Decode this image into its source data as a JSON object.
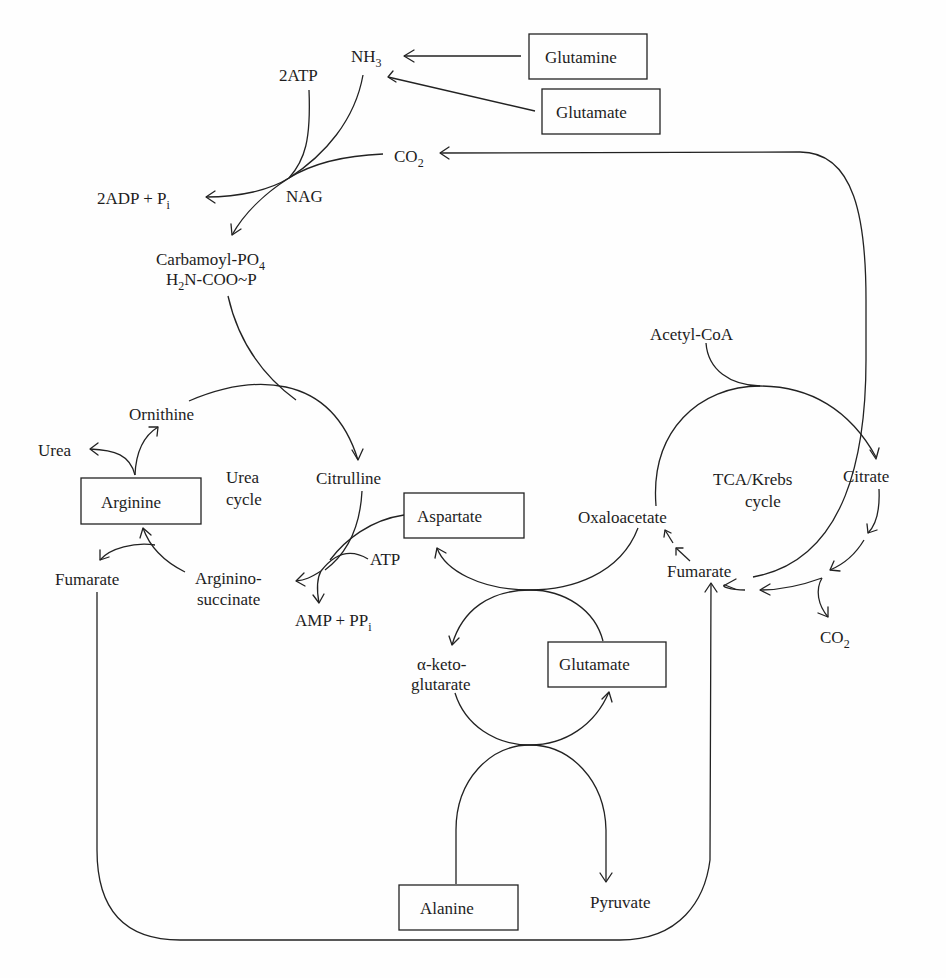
{
  "diagram": {
    "colors": {
      "line": "#222222",
      "text": "#1d1d1d",
      "background": "#fefefe"
    },
    "nodes": {
      "glutamine_top": "Glutamine",
      "glutamate_top": "Glutamate",
      "nh3": {
        "main": "NH",
        "sub": "3"
      },
      "atp2": "2ATP",
      "co2_top": {
        "main": "CO",
        "sub": "2"
      },
      "adp": {
        "main": "2ADP + P",
        "sub": "i"
      },
      "nag": "NAG",
      "carbamoyl_1": {
        "main": "Carbamoyl-PO",
        "sub": "4"
      },
      "carbamoyl_2": {
        "pre": "H",
        "sub": "2",
        "post": "N-COO~P"
      },
      "ornithine": "Ornithine",
      "urea": "Urea",
      "urea_cycle_1": "Urea",
      "urea_cycle_2": "cycle",
      "citrulline": "Citrulline",
      "arginine": "Arginine",
      "aspartate": "Aspartate",
      "atp": "ATP",
      "fumarate_left": "Fumarate",
      "argininosuccinate_1": "Arginino-",
      "argininosuccinate_2": "succinate",
      "amp": {
        "main": "AMP + PP",
        "sub": "i"
      },
      "acetyl_coa": "Acetyl-CoA",
      "tca_1": "TCA/Krebs",
      "tca_2": "cycle",
      "citrate": "Citrate",
      "oxaloacetate": "Oxaloacetate",
      "fumarate_right": "Fumarate",
      "co2_right": {
        "main": "CO",
        "sub": "2"
      },
      "aketo_1": "α-keto-",
      "aketo_2": "glutarate",
      "glutamate_mid": "Glutamate",
      "alanine": "Alanine",
      "pyruvate": "Pyruvate"
    }
  }
}
